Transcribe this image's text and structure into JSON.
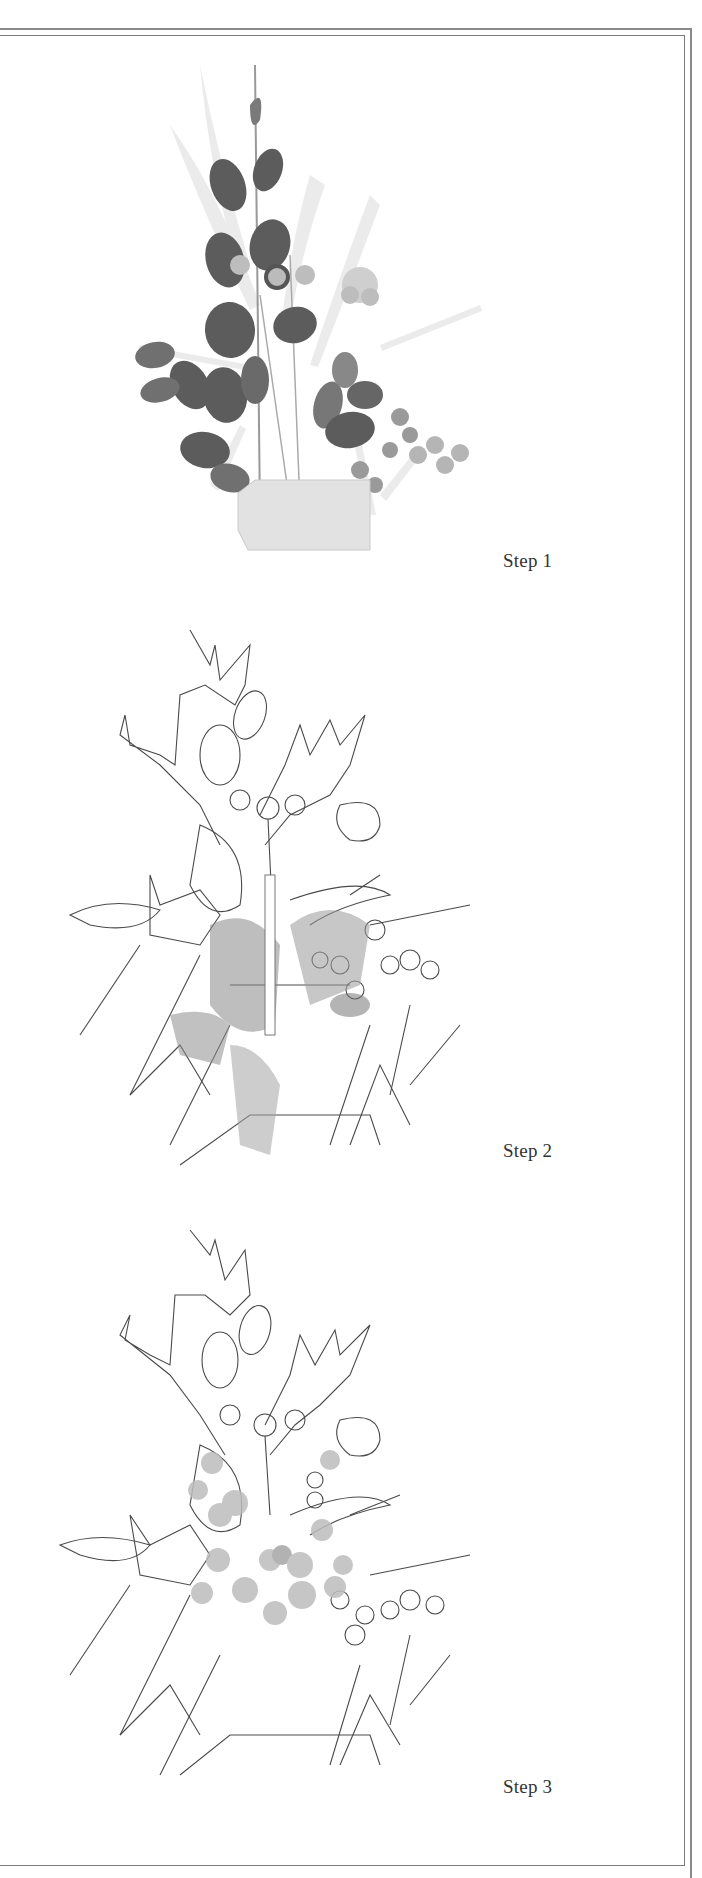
{
  "page": {
    "type": "illustration-plate"
  },
  "steps": [
    {
      "label": "Step 1",
      "stage": "watercolor-foliage"
    },
    {
      "label": "Step 2",
      "stage": "line-drawing-with-washes"
    },
    {
      "label": "Step 3",
      "stage": "line-drawing-with-berries"
    }
  ],
  "colors": {
    "frame": "#8a8a8a",
    "ink": "#3a3a3a",
    "dark_leaf": "#5a5a5a",
    "mid_wash": "#9a9a9a",
    "light_wash": "#d6d6d6",
    "label": "#333333"
  }
}
